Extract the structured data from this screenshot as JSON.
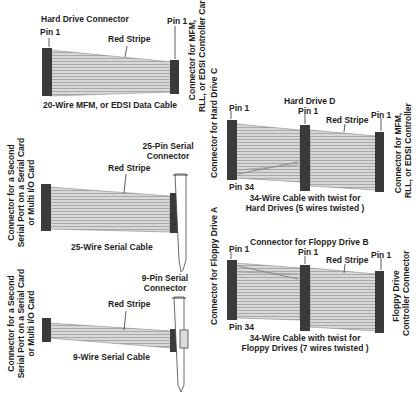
{
  "diagram": {
    "colors": {
      "connector": "#3a3a3a",
      "cable_fill": "#d6d6d6",
      "cable_lines": "#9a9a9a",
      "text": "#1e1e1e"
    },
    "cable_hdd_20": {
      "top_label": "Hard Drive Connector",
      "pin_left": "Pin 1",
      "pin_right": "Pin 1",
      "stripe_label": "Red Stripe",
      "right_connector_label_line1": "Connector for MFM,",
      "right_connector_label_line2": "RLL, or EDSI Controller Card",
      "caption": "20-Wire MFM, or EDSI Data Cable"
    },
    "cable_serial_25": {
      "left_connector_label_line1": "Connector for a Second",
      "left_connector_label_line2": "Serial Port on a Serial Card",
      "left_connector_label_line3": "or Multi I/O Card",
      "top_label_line1": "25-Pin Serial",
      "top_label_line2": "Connector",
      "stripe_label": "Red Stripe",
      "caption": "25-Wire Serial Cable"
    },
    "cable_serial_9": {
      "left_connector_label_line1": "Connector for a Second",
      "left_connector_label_line2": "Serial Port on a Serial Card",
      "left_connector_label_line3": "or Multi I/O Card",
      "top_label_line1": "9-Pin Serial",
      "top_label_line2": "Connector",
      "stripe_label": "Red Stripe",
      "caption": "9-Wire Serial Cable"
    },
    "cable_hdd_34": {
      "left_connector_label": "Connector for Hard Drive C",
      "middle_label": "Hard Drive D",
      "pin_left": "Pin 1",
      "pin_middle": "Pin 1",
      "pin_right": "Pin 1",
      "pin_bottom": "Pin 34",
      "stripe_label": "Red Stripe",
      "right_connector_label_line1": "Connector for MFM,",
      "right_connector_label_line2": "RLL, or EDSI Controller",
      "caption_line1": "34-Wire Cable with twist for",
      "caption_line2": "Hard Drives (5 wires twisted )"
    },
    "cable_floppy_34": {
      "left_connector_label": "Connector for Floppy Drive A",
      "middle_label": "Connector for Floppy Drive B",
      "pin_left": "Pin 1",
      "pin_middle": "Pin 1",
      "pin_right": "Pin 1",
      "pin_bottom": "Pin 34",
      "stripe_label": "Red Stripe",
      "right_connector_label_line1": "Floppy Drive",
      "right_connector_label_line2": "Controller Connector",
      "caption_line1": "34-Wire Cable with twist for",
      "caption_line2": "Floppy Drives (7 wires twisted )"
    }
  }
}
